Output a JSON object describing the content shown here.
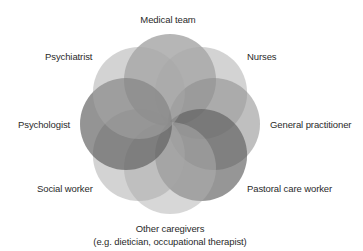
{
  "diagram": {
    "type": "rosette-venn",
    "center": {
      "x": 170,
      "y": 124
    },
    "radius": 46,
    "offset": 44,
    "circles": [
      {
        "name": "Medical team",
        "angle_deg": -90,
        "fill": "#7a7a7a",
        "opacity": 0.55
      },
      {
        "name": "Nurses",
        "angle_deg": -45,
        "fill": "#a8a8a8",
        "opacity": 0.5
      },
      {
        "name": "General practitioner",
        "angle_deg": 0,
        "fill": "#8a8a8a",
        "opacity": 0.55
      },
      {
        "name": "Pastoral care worker",
        "angle_deg": 45,
        "fill": "#5e5e5e",
        "opacity": 0.65
      },
      {
        "name": "Other caregivers",
        "angle_deg": 90,
        "fill": "#b0b0b0",
        "opacity": 0.5
      },
      {
        "name": "Social worker",
        "angle_deg": 135,
        "fill": "#a8a8a8",
        "opacity": 0.5
      },
      {
        "name": "Psychologist",
        "angle_deg": 180,
        "fill": "#5a5a5a",
        "opacity": 0.65
      },
      {
        "name": "Psychiatrist",
        "angle_deg": -135,
        "fill": "#a8a8a8",
        "opacity": 0.5
      }
    ]
  },
  "labels": {
    "medical_team": "Medical team",
    "psychiatrist": "Psychiatrist",
    "nurses": "Nurses",
    "psychologist": "Psychologist",
    "general_practitioner": "General practitioner",
    "social_worker": "Social worker",
    "pastoral_care_worker": "Pastoral care worker",
    "other_caregivers_line1": "Other caregivers",
    "other_caregivers_line2": "(e.g. dietician, occupational therapist)"
  }
}
